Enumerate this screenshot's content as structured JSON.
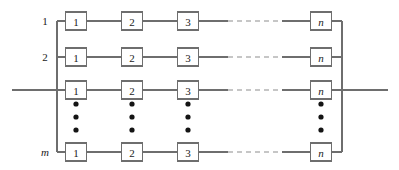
{
  "figure": {
    "kind": "reliability-block-diagram",
    "background_color": "#ffffff",
    "line_color": "#6e6e6e",
    "dashed_line_color": "#8d8d8d",
    "text_color": "#1a1a1a",
    "dot_color": "#141414"
  },
  "geometry": {
    "width": 399,
    "height": 170,
    "left_bus_x": 57,
    "right_bus_x": 342,
    "bus_top_y": 21,
    "bus_bottom_y": 152,
    "lead_left_x": 12,
    "lead_right_x": 388,
    "lead_y": 90,
    "box_width": 21,
    "box_height": 18,
    "column_centers": [
      76,
      132,
      188,
      321
    ],
    "dashed_span": [
      228,
      282
    ],
    "row_centers": [
      21,
      57,
      90,
      152
    ],
    "dots_rows_y": [
      104,
      117,
      130
    ],
    "dots_columns_x": [
      76,
      132,
      188,
      321
    ]
  },
  "row_labels": [
    {
      "text": "1",
      "italic": false,
      "x": 45,
      "y": 21
    },
    {
      "text": "2",
      "italic": false,
      "x": 45,
      "y": 57
    },
    {
      "text": "m",
      "italic": true,
      "x": 45,
      "y": 152
    }
  ],
  "rows": [
    {
      "name": "row-1",
      "label": "1",
      "y": 21,
      "blocks": [
        {
          "label": "1",
          "italic": false,
          "cx": 76
        },
        {
          "label": "2",
          "italic": false,
          "cx": 132
        },
        {
          "label": "3",
          "italic": false,
          "cx": 188
        },
        {
          "label": "n",
          "italic": true,
          "cx": 321
        }
      ]
    },
    {
      "name": "row-2",
      "label": "2",
      "y": 57,
      "blocks": [
        {
          "label": "1",
          "italic": false,
          "cx": 76
        },
        {
          "label": "2",
          "italic": false,
          "cx": 132
        },
        {
          "label": "3",
          "italic": false,
          "cx": 188
        },
        {
          "label": "n",
          "italic": true,
          "cx": 321
        }
      ]
    },
    {
      "name": "row-3",
      "label": "",
      "y": 90,
      "blocks": [
        {
          "label": "1",
          "italic": false,
          "cx": 76
        },
        {
          "label": "2",
          "italic": false,
          "cx": 132
        },
        {
          "label": "3",
          "italic": false,
          "cx": 188
        },
        {
          "label": "n",
          "italic": true,
          "cx": 321
        }
      ]
    },
    {
      "name": "row-m",
      "label": "m",
      "y": 152,
      "blocks": [
        {
          "label": "1",
          "italic": false,
          "cx": 76
        },
        {
          "label": "2",
          "italic": false,
          "cx": 132
        },
        {
          "label": "3",
          "italic": false,
          "cx": 188
        },
        {
          "label": "n",
          "italic": true,
          "cx": 321
        }
      ]
    }
  ],
  "vertical_ellipses": [
    {
      "name": "ellipsis-col-1",
      "cx": 76
    },
    {
      "name": "ellipsis-col-2",
      "cx": 132
    },
    {
      "name": "ellipsis-col-3",
      "cx": 188
    },
    {
      "name": "ellipsis-col-n",
      "cx": 321
    }
  ]
}
